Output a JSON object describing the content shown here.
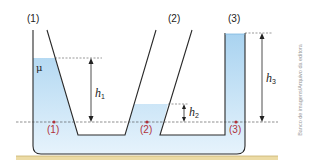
{
  "diagram": {
    "tubes": [
      {
        "id": "tube-1",
        "label": "(1)"
      },
      {
        "id": "tube-2",
        "label": "(2)"
      },
      {
        "id": "tube-3",
        "label": "(3)"
      }
    ],
    "points": [
      {
        "id": "point-1",
        "label": "(1)"
      },
      {
        "id": "point-2",
        "label": "(2)"
      },
      {
        "id": "point-3",
        "label": "(3)"
      }
    ],
    "heights": [
      {
        "id": "h1",
        "symbol": "h",
        "subscript": "1"
      },
      {
        "id": "h2",
        "symbol": "h",
        "subscript": "2"
      },
      {
        "id": "h3",
        "symbol": "h",
        "subscript": "3"
      }
    ],
    "fluid_density_symbol": "μ",
    "credit": "Banco de imagens/Arquivo da editora",
    "colors": {
      "water_top": "#a9d3f0",
      "water_bottom": "#e3f1fb",
      "outline": "#2a2a2a",
      "point": "#b0323a",
      "ground": "#e8d59a",
      "dashed": "#555555"
    }
  }
}
